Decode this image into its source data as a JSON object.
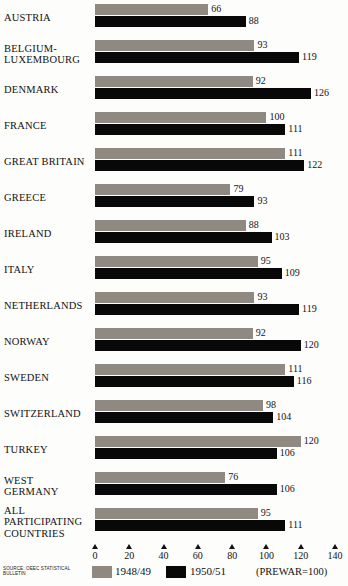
{
  "chart_data": {
    "type": "bar",
    "orientation": "horizontal",
    "title": "",
    "subtitle": "",
    "xlabel": "",
    "ylabel": "",
    "xlim": [
      0,
      140
    ],
    "grid": false,
    "legend_position": "bottom",
    "note": "(PREWAR=100)",
    "source": "SOURCE: OEEC STATISTICAL BULLETIN",
    "categories": [
      "AUSTRIA",
      "BELGIUM-\nLUXEMBOURG",
      "DENMARK",
      "FRANCE",
      "GREAT BRITAIN",
      "GREECE",
      "IRELAND",
      "ITALY",
      "NETHERLANDS",
      "NORWAY",
      "SWEDEN",
      "SWITZERLAND",
      "TURKEY",
      "WEST\nGERMANY",
      "ALL\nPARTICIPATING\nCOUNTRIES"
    ],
    "series": [
      {
        "name": "1948/49",
        "color": "#8f8981",
        "values": [
          66,
          93,
          92,
          100,
          111,
          79,
          88,
          95,
          93,
          92,
          111,
          98,
          120,
          76,
          95
        ]
      },
      {
        "name": "1950/51",
        "color": "#080808",
        "values": [
          88,
          119,
          126,
          111,
          122,
          93,
          103,
          109,
          119,
          120,
          116,
          104,
          106,
          106,
          111
        ]
      }
    ],
    "xticks": [
      0,
      20,
      40,
      60,
      80,
      100,
      120,
      140
    ],
    "xtick_labels": [
      "0",
      "20",
      "40",
      "60",
      "80",
      "100",
      "120",
      "140"
    ]
  },
  "legend": {
    "items": [
      {
        "label": "1948/49",
        "color": "#8f8981"
      },
      {
        "label": "1950/51",
        "color": "#080808"
      }
    ],
    "note": "(PREWAR=100)"
  },
  "footer": {
    "source": "SOURCE: OEEC STATISTICAL BULLETIN"
  }
}
